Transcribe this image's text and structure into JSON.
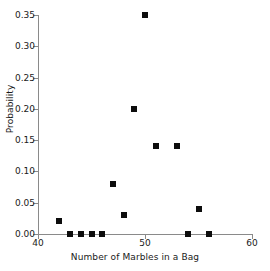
{
  "chart_data": {
    "type": "scatter",
    "title": "",
    "xlabel": "Number of Marbles in a Bag",
    "ylabel": "Probability",
    "xlim": [
      40,
      60
    ],
    "ylim": [
      0.0,
      0.35
    ],
    "grid": false,
    "legend": null,
    "xticks": [
      40,
      50,
      60
    ],
    "xtick_labels": [
      "40",
      "50",
      "60"
    ],
    "yticks": [
      0.0,
      0.05,
      0.1,
      0.15,
      0.2,
      0.25,
      0.3,
      0.35
    ],
    "ytick_labels": [
      "0.00",
      "0.05",
      "0.10",
      "0.15",
      "0.20",
      "0.25",
      "0.30",
      "0.35"
    ],
    "marker": "square",
    "marker_color": "#0d0d0d",
    "x": [
      42,
      43,
      44,
      45,
      46,
      47,
      48,
      49,
      50,
      51,
      53,
      54,
      55,
      56
    ],
    "y": [
      0.02,
      0.0,
      0.0,
      0.0,
      0.0,
      0.08,
      0.03,
      0.2,
      0.35,
      0.14,
      0.14,
      0.0,
      0.04,
      0.0
    ],
    "points": [
      {
        "x": 42,
        "y": 0.02
      },
      {
        "x": 43,
        "y": 0.0
      },
      {
        "x": 44,
        "y": 0.0
      },
      {
        "x": 45,
        "y": 0.0
      },
      {
        "x": 46,
        "y": 0.0
      },
      {
        "x": 47,
        "y": 0.08
      },
      {
        "x": 48,
        "y": 0.03
      },
      {
        "x": 49,
        "y": 0.2
      },
      {
        "x": 50,
        "y": 0.35
      },
      {
        "x": 51,
        "y": 0.14
      },
      {
        "x": 53,
        "y": 0.14
      },
      {
        "x": 54,
        "y": 0.0
      },
      {
        "x": 55,
        "y": 0.04
      },
      {
        "x": 56,
        "y": 0.0
      }
    ]
  }
}
